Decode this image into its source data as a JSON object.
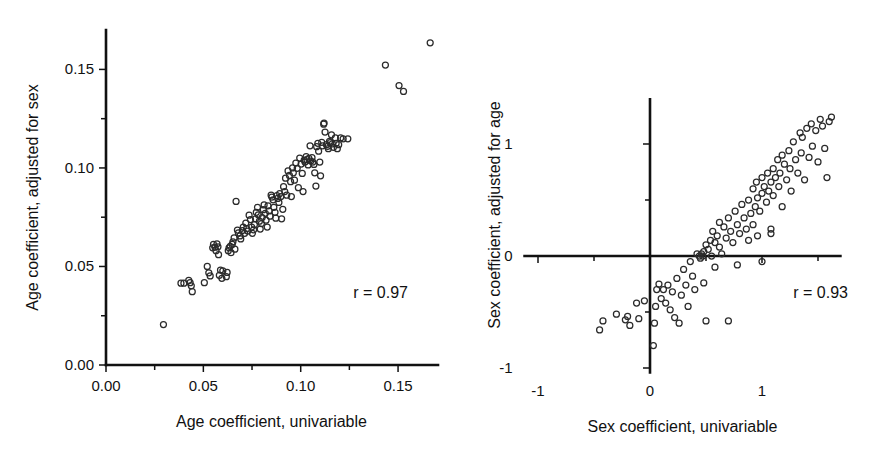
{
  "figure": {
    "panel_count": 2,
    "background": "#ffffff",
    "marker_color": "#2b2b2b",
    "axis_color": "#111111"
  },
  "chart_data": [
    {
      "type": "scatter",
      "panel": "left",
      "title": "",
      "xlabel": "Age coefficient, univariable",
      "ylabel": "Age coefficient, adjusted for sex",
      "annotation": "r = 0.97",
      "correlation": 0.97,
      "xlim": [
        0.0,
        0.17
      ],
      "ylim": [
        0.0,
        0.17
      ],
      "xticks": [
        0.0,
        0.05,
        0.1,
        0.15
      ],
      "xticklabels": [
        "0.00",
        "0.05",
        "0.10",
        "0.15"
      ],
      "yticks": [
        0.0,
        0.05,
        0.1,
        0.15
      ],
      "yticklabels": [
        "0.00",
        "0.05",
        "0.10",
        "0.15"
      ],
      "minor_tick_step": 0.025,
      "grid": false,
      "legend": "none",
      "marker": "open-circle",
      "points": [
        [
          0.0295,
          0.0205
        ],
        [
          0.0385,
          0.0415
        ],
        [
          0.04,
          0.0415
        ],
        [
          0.0425,
          0.043
        ],
        [
          0.0432,
          0.0418
        ],
        [
          0.0438,
          0.0402
        ],
        [
          0.0443,
          0.0372
        ],
        [
          0.0505,
          0.0418
        ],
        [
          0.052,
          0.05
        ],
        [
          0.0528,
          0.0468
        ],
        [
          0.0535,
          0.0452
        ],
        [
          0.0548,
          0.0595
        ],
        [
          0.0552,
          0.0612
        ],
        [
          0.056,
          0.0598
        ],
        [
          0.0565,
          0.058
        ],
        [
          0.057,
          0.0615
        ],
        [
          0.0575,
          0.06
        ],
        [
          0.0578,
          0.056
        ],
        [
          0.0582,
          0.0455
        ],
        [
          0.0588,
          0.0482
        ],
        [
          0.0595,
          0.044
        ],
        [
          0.06,
          0.0478
        ],
        [
          0.0618,
          0.0448
        ],
        [
          0.0622,
          0.047
        ],
        [
          0.0628,
          0.058
        ],
        [
          0.0632,
          0.0595
        ],
        [
          0.0638,
          0.0602
        ],
        [
          0.0642,
          0.057
        ],
        [
          0.0648,
          0.0612
        ],
        [
          0.0652,
          0.0625
        ],
        [
          0.0658,
          0.0645
        ],
        [
          0.0662,
          0.0588
        ],
        [
          0.0668,
          0.083
        ],
        [
          0.0675,
          0.0685
        ],
        [
          0.068,
          0.067
        ],
        [
          0.0688,
          0.0655
        ],
        [
          0.0692,
          0.064
        ],
        [
          0.07,
          0.0682
        ],
        [
          0.0705,
          0.07
        ],
        [
          0.0712,
          0.0668
        ],
        [
          0.0718,
          0.072
        ],
        [
          0.0722,
          0.0692
        ],
        [
          0.0728,
          0.068
        ],
        [
          0.0735,
          0.076
        ],
        [
          0.0742,
          0.0738
        ],
        [
          0.0748,
          0.07
        ],
        [
          0.0752,
          0.0668
        ],
        [
          0.0758,
          0.0686
        ],
        [
          0.0762,
          0.0712
        ],
        [
          0.0768,
          0.0742
        ],
        [
          0.0772,
          0.0775
        ],
        [
          0.0778,
          0.08
        ],
        [
          0.0782,
          0.0762
        ],
        [
          0.0788,
          0.073
        ],
        [
          0.0792,
          0.069
        ],
        [
          0.0798,
          0.0718
        ],
        [
          0.0802,
          0.0748
        ],
        [
          0.0808,
          0.0788
        ],
        [
          0.0812,
          0.0812
        ],
        [
          0.0818,
          0.077
        ],
        [
          0.0822,
          0.0735
        ],
        [
          0.0828,
          0.07
        ],
        [
          0.0832,
          0.0808
        ],
        [
          0.0838,
          0.0782
        ],
        [
          0.0842,
          0.0755
        ],
        [
          0.0848,
          0.0862
        ],
        [
          0.0852,
          0.0852
        ],
        [
          0.0858,
          0.0838
        ],
        [
          0.0862,
          0.08
        ],
        [
          0.0868,
          0.0775
        ],
        [
          0.0872,
          0.0745
        ],
        [
          0.0878,
          0.086
        ],
        [
          0.0882,
          0.0845
        ],
        [
          0.0888,
          0.0825
        ],
        [
          0.0892,
          0.087
        ],
        [
          0.0898,
          0.0855
        ],
        [
          0.0902,
          0.0742
        ],
        [
          0.0908,
          0.079
        ],
        [
          0.0912,
          0.0905
        ],
        [
          0.0918,
          0.088
        ],
        [
          0.0922,
          0.0948
        ],
        [
          0.0928,
          0.0862
        ],
        [
          0.0935,
          0.0985
        ],
        [
          0.0942,
          0.0962
        ],
        [
          0.0948,
          0.093
        ],
        [
          0.0952,
          0.0855
        ],
        [
          0.0958,
          0.1
        ],
        [
          0.0962,
          0.0975
        ],
        [
          0.0968,
          0.0938
        ],
        [
          0.0975,
          0.1025
        ],
        [
          0.0982,
          0.0998
        ],
        [
          0.0988,
          0.09
        ],
        [
          0.0995,
          0.105
        ],
        [
          0.1002,
          0.102
        ],
        [
          0.1008,
          0.0972
        ],
        [
          0.1012,
          0.088
        ],
        [
          0.1018,
          0.104
        ],
        [
          0.1022,
          0.103
        ],
        [
          0.1028,
          0.1058
        ],
        [
          0.1032,
          0.1042
        ],
        [
          0.1038,
          0.1015
        ],
        [
          0.1042,
          0.1048
        ],
        [
          0.1048,
          0.1112
        ],
        [
          0.1052,
          0.1035
        ],
        [
          0.1058,
          0.1052
        ],
        [
          0.1062,
          0.103
        ],
        [
          0.1068,
          0.1018
        ],
        [
          0.1072,
          0.0975
        ],
        [
          0.1078,
          0.0908
        ],
        [
          0.1082,
          0.1108
        ],
        [
          0.1088,
          0.1125
        ],
        [
          0.1092,
          0.1085
        ],
        [
          0.1098,
          0.103
        ],
        [
          0.1102,
          0.096
        ],
        [
          0.1108,
          0.113
        ],
        [
          0.1112,
          0.1112
        ],
        [
          0.1118,
          0.1222
        ],
        [
          0.112,
          0.1228
        ],
        [
          0.1125,
          0.1182
        ],
        [
          0.1132,
          0.1118
        ],
        [
          0.1138,
          0.111
        ],
        [
          0.1142,
          0.1098
        ],
        [
          0.1148,
          0.1135
        ],
        [
          0.1152,
          0.1128
        ],
        [
          0.1158,
          0.1168
        ],
        [
          0.1162,
          0.1122
        ],
        [
          0.1168,
          0.1105
        ],
        [
          0.1178,
          0.1152
        ],
        [
          0.1182,
          0.1125
        ],
        [
          0.1188,
          0.1098
        ],
        [
          0.1195,
          0.1118
        ],
        [
          0.1205,
          0.1152
        ],
        [
          0.1218,
          0.1148
        ],
        [
          0.1242,
          0.1148
        ],
        [
          0.1435,
          0.1522
        ],
        [
          0.1505,
          0.1418
        ],
        [
          0.1528,
          0.1388
        ],
        [
          0.1665,
          0.1635
        ]
      ]
    },
    {
      "type": "scatter",
      "panel": "right",
      "title": "",
      "xlabel": "Sex coefficient, univariable",
      "ylabel": "Sex coefficient, adjusted for age",
      "annotation": "r = 0.93",
      "correlation": 0.93,
      "xlim": [
        -1.0,
        1.65
      ],
      "ylim": [
        -1.0,
        1.4
      ],
      "xticks": [
        -1,
        0,
        1
      ],
      "xticklabels": [
        "-1",
        "0",
        "1"
      ],
      "yticks": [
        -1,
        0,
        1
      ],
      "yticklabels": [
        "-1",
        "0",
        "1"
      ],
      "minor_tick_step": 0.5,
      "grid": false,
      "legend": "none",
      "marker": "open-circle",
      "axes_cross_at_origin": true,
      "points": [
        [
          0.03,
          -0.8
        ],
        [
          0.04,
          -0.6
        ],
        [
          0.05,
          -0.45
        ],
        [
          0.06,
          -0.3
        ],
        [
          0.08,
          -0.25
        ],
        [
          -0.42,
          -0.58
        ],
        [
          -0.45,
          -0.66
        ],
        [
          -0.3,
          -0.52
        ],
        [
          -0.22,
          -0.57
        ],
        [
          -0.2,
          -0.54
        ],
        [
          -0.18,
          -0.62
        ],
        [
          -0.12,
          -0.42
        ],
        [
          -0.1,
          -0.56
        ],
        [
          -0.05,
          -0.4
        ],
        [
          0.1,
          -0.38
        ],
        [
          0.12,
          -0.3
        ],
        [
          0.14,
          -0.42
        ],
        [
          0.16,
          -0.26
        ],
        [
          0.18,
          -0.48
        ],
        [
          0.2,
          -0.32
        ],
        [
          0.22,
          -0.55
        ],
        [
          0.24,
          -0.2
        ],
        [
          0.26,
          -0.6
        ],
        [
          0.28,
          -0.35
        ],
        [
          0.3,
          -0.12
        ],
        [
          0.32,
          -0.26
        ],
        [
          0.34,
          -0.45
        ],
        [
          0.36,
          -0.05
        ],
        [
          0.38,
          -0.18
        ],
        [
          0.4,
          -0.3
        ],
        [
          0.42,
          0.02
        ],
        [
          0.44,
          0.0
        ],
        [
          0.45,
          -0.02
        ],
        [
          0.46,
          0.02
        ],
        [
          0.47,
          0.0
        ],
        [
          0.48,
          0.04
        ],
        [
          0.48,
          -0.24
        ],
        [
          0.5,
          0.1
        ],
        [
          0.5,
          -0.58
        ],
        [
          0.52,
          0.06
        ],
        [
          0.54,
          0.14
        ],
        [
          0.55,
          0.0
        ],
        [
          0.56,
          0.22
        ],
        [
          0.58,
          0.12
        ],
        [
          0.58,
          -0.1
        ],
        [
          0.6,
          0.18
        ],
        [
          0.62,
          0.08
        ],
        [
          0.62,
          0.3
        ],
        [
          0.64,
          0.02
        ],
        [
          0.66,
          0.26
        ],
        [
          0.68,
          0.16
        ],
        [
          0.7,
          0.34
        ],
        [
          0.7,
          -0.58
        ],
        [
          0.72,
          0.22
        ],
        [
          0.74,
          0.12
        ],
        [
          0.76,
          0.4
        ],
        [
          0.78,
          0.28
        ],
        [
          0.78,
          -0.08
        ],
        [
          0.8,
          0.2
        ],
        [
          0.82,
          0.46
        ],
        [
          0.84,
          0.34
        ],
        [
          0.86,
          0.24
        ],
        [
          0.88,
          0.5
        ],
        [
          0.88,
          0.14
        ],
        [
          0.9,
          0.38
        ],
        [
          0.92,
          0.6
        ],
        [
          0.92,
          0.28
        ],
        [
          0.94,
          0.44
        ],
        [
          0.95,
          0.66
        ],
        [
          0.96,
          0.52
        ],
        [
          0.96,
          0.18
        ],
        [
          0.98,
          0.4
        ],
        [
          1.0,
          0.7
        ],
        [
          1.0,
          0.56
        ],
        [
          1.0,
          -0.05
        ],
        [
          1.02,
          0.62
        ],
        [
          1.04,
          0.48
        ],
        [
          1.05,
          0.74
        ],
        [
          1.06,
          0.58
        ],
        [
          1.08,
          0.66
        ],
        [
          1.08,
          0.24
        ],
        [
          1.08,
          0.2
        ],
        [
          1.1,
          0.78
        ],
        [
          1.1,
          0.54
        ],
        [
          1.12,
          0.7
        ],
        [
          1.14,
          0.86
        ],
        [
          1.15,
          0.62
        ],
        [
          1.16,
          0.74
        ],
        [
          1.18,
          0.9
        ],
        [
          1.18,
          0.44
        ],
        [
          1.2,
          0.82
        ],
        [
          1.22,
          0.68
        ],
        [
          1.24,
          0.94
        ],
        [
          1.25,
          0.78
        ],
        [
          1.26,
          0.58
        ],
        [
          1.28,
          1.02
        ],
        [
          1.3,
          0.86
        ],
        [
          1.32,
          0.74
        ],
        [
          1.34,
          1.1
        ],
        [
          1.35,
          0.92
        ],
        [
          1.36,
          1.06
        ],
        [
          1.38,
          0.68
        ],
        [
          1.4,
          1.14
        ],
        [
          1.42,
          0.88
        ],
        [
          1.44,
          1.18
        ],
        [
          1.45,
          0.98
        ],
        [
          1.48,
          1.12
        ],
        [
          1.5,
          0.84
        ],
        [
          1.52,
          1.22
        ],
        [
          1.54,
          1.16
        ],
        [
          1.56,
          0.96
        ],
        [
          1.58,
          0.7
        ],
        [
          1.6,
          1.2
        ],
        [
          1.62,
          1.24
        ]
      ]
    }
  ]
}
